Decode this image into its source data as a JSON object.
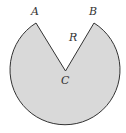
{
  "diagram": {
    "type": "circle-sector",
    "center": {
      "x": 65.5,
      "y": 71
    },
    "radius": 55,
    "fill_color": "#d9d9d9",
    "stroke_color": "#333333",
    "points": {
      "A": {
        "label": "A",
        "x": 36,
        "y": 23
      },
      "B": {
        "label": "B",
        "x": 94,
        "y": 23
      },
      "C": {
        "label": "C",
        "x": 65.5,
        "y": 71
      }
    },
    "labels": {
      "A": "A",
      "B": "B",
      "C": "C",
      "R": "R"
    }
  }
}
